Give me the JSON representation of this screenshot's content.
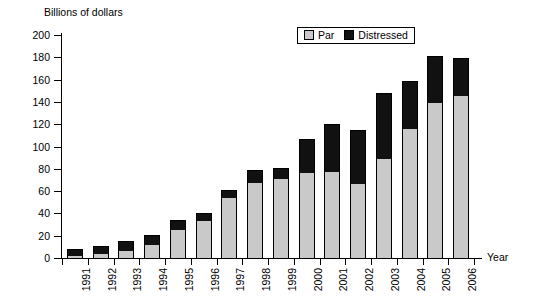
{
  "chart_data": {
    "type": "bar",
    "stacked": true,
    "title": "",
    "ylabel": "Billions of dollars",
    "xlabel": "Year",
    "ylim": [
      0,
      200
    ],
    "ytick_step": 20,
    "yticks": [
      0,
      20,
      40,
      60,
      80,
      100,
      120,
      140,
      160,
      180,
      200
    ],
    "grid": false,
    "legend_position": "top-right",
    "categories": [
      "1991",
      "1992",
      "1993",
      "1994",
      "1995",
      "1996",
      "1997",
      "1998",
      "1999",
      "2000",
      "2001",
      "2002",
      "2003",
      "2004",
      "2005",
      "2006"
    ],
    "series": [
      {
        "name": "Par",
        "color": "#c9c9c9",
        "values": [
          2,
          4,
          6,
          12,
          25,
          33,
          54,
          67,
          71,
          76,
          77,
          66,
          89,
          116,
          139,
          145
        ]
      },
      {
        "name": "Distressed",
        "color": "#111111",
        "values": [
          6,
          7,
          9,
          9,
          9,
          7,
          7,
          12,
          10,
          31,
          43,
          49,
          59,
          43,
          42,
          34
        ]
      }
    ],
    "totals": [
      8,
      11,
      15,
      21,
      34,
      40,
      61,
      79,
      81,
      107,
      120,
      115,
      148,
      159,
      181,
      179
    ]
  },
  "legend": {
    "items": [
      {
        "label": "Par",
        "swatch": "par-swatch"
      },
      {
        "label": "Distressed",
        "swatch": "distressed-swatch"
      }
    ]
  },
  "axes": {
    "y_title": "Billions of dollars",
    "x_title": "Year"
  }
}
